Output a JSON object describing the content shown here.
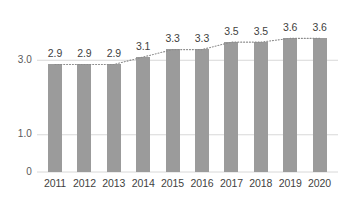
{
  "chart_data": {
    "type": "bar",
    "title": "",
    "subtitle": "",
    "xlabel": "",
    "ylabel": "",
    "categories": [
      "2011",
      "2012",
      "2013",
      "2014",
      "2015",
      "2016",
      "2017",
      "2018",
      "2019",
      "2020"
    ],
    "values": [
      2.9,
      2.9,
      2.9,
      3.1,
      3.3,
      3.3,
      3.5,
      3.5,
      3.6,
      3.6
    ],
    "data_labels": [
      "2.9",
      "2.9",
      "2.9",
      "3.1",
      "3.3",
      "3.3",
      "3.5",
      "3.5",
      "3.6",
      "3.6"
    ],
    "series": [
      {
        "name": "",
        "type": "bar",
        "values": [
          2.9,
          2.9,
          2.9,
          3.1,
          3.3,
          3.3,
          3.5,
          3.5,
          3.6,
          3.6
        ]
      },
      {
        "name": "",
        "type": "line",
        "style": "dotted",
        "values": [
          2.9,
          2.9,
          2.9,
          3.1,
          3.3,
          3.3,
          3.5,
          3.5,
          3.6,
          3.6
        ]
      }
    ],
    "ylim": [
      0,
      3.8
    ],
    "ytick_values": [
      0,
      1.0,
      3.0
    ],
    "ytick_labels": [
      "0",
      "1.0",
      "3.0"
    ],
    "grid": true,
    "gridlines_at": [
      1.0,
      3.0
    ],
    "legend": false,
    "legend_position": "none",
    "colors": {
      "bar": "#9b9b9b",
      "trend_line": "#8c8c8c",
      "gridline": "#d8d8d8",
      "axis_line": "#d8d8d8",
      "tick_label": "#3f3f41",
      "y_tick_label": "#59595b",
      "background": "#ffffff"
    }
  }
}
